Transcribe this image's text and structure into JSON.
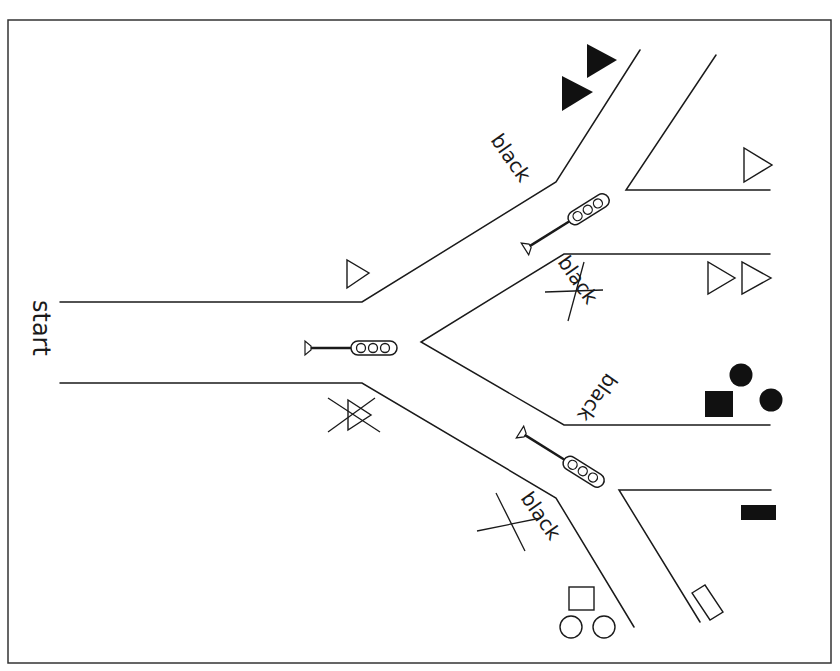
{
  "figure": {
    "type": "branching-road-diagram",
    "background": "#ffffff",
    "ink": "#1a1a1a",
    "frame": {
      "x": 8,
      "y": 20,
      "width": 823,
      "height": 643
    }
  },
  "labels": {
    "start": "start",
    "upper_road": "black",
    "middle_upper": "black",
    "middle_lower": "black",
    "lower_road": "black"
  },
  "crossed_out": {
    "middle_upper_label": true,
    "lower_road_label": true,
    "left_outline_triangle": true
  },
  "traffic_lights": [
    {
      "id": "main",
      "lamps": 3,
      "position": "start-road junction"
    },
    {
      "id": "upper",
      "lamps": 3,
      "position": "upper branch"
    },
    {
      "id": "lower",
      "lamps": 3,
      "position": "lower branch"
    }
  ],
  "shapes": {
    "top_left_branch": [
      "filled-triangle",
      "filled-triangle"
    ],
    "upper_right_pocket": [
      "outline-triangle"
    ],
    "middle_upper_end": [
      "outline-triangle",
      "outline-triangle"
    ],
    "middle_lower_end": [
      "filled-square",
      "filled-circle",
      "filled-circle"
    ],
    "lower_right_pocket": [
      "filled-rectangle",
      "outline-rectangle"
    ],
    "bottom_left": [
      "outline-square",
      "outline-circle",
      "outline-circle"
    ],
    "left_upper": [
      "outline-triangle"
    ],
    "left_lower": [
      "outline-triangle-crossed"
    ]
  }
}
